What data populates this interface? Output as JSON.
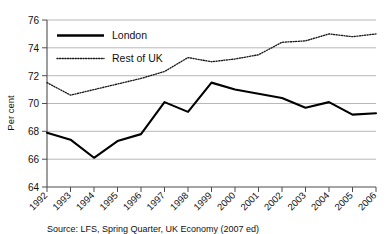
{
  "chart_data": {
    "type": "line",
    "title": "",
    "subtitle": "",
    "xlabel": "",
    "ylabel": "Per cent",
    "x": [
      "1992",
      "1993",
      "1994",
      "1995",
      "1996",
      "1997",
      "1998",
      "1999",
      "2000",
      "2001",
      "2002",
      "2003",
      "2004",
      "2005",
      "2006"
    ],
    "categories": [
      "1992",
      "1993",
      "1994",
      "1995",
      "1996",
      "1997",
      "1998",
      "1999",
      "2000",
      "2001",
      "2002",
      "2003",
      "2004",
      "2005",
      "2006"
    ],
    "ylim": [
      64,
      76
    ],
    "yticks": [
      64,
      66,
      68,
      70,
      72,
      74,
      76
    ],
    "ytick_labels": [
      "64",
      "66",
      "68",
      "70",
      "72",
      "74",
      "76"
    ],
    "grid": true,
    "legend_position": "top-left-inside",
    "series": [
      {
        "name": "London",
        "style": "solid",
        "color": "#000000",
        "values": [
          67.9,
          67.4,
          66.1,
          67.3,
          67.8,
          70.1,
          69.4,
          71.5,
          71.0,
          70.7,
          70.4,
          69.7,
          70.1,
          69.2,
          69.3
        ]
      },
      {
        "name": "Rest of UK",
        "style": "dotted",
        "color": "#1a1a1a",
        "values": [
          71.5,
          70.6,
          71.0,
          71.4,
          71.8,
          72.3,
          73.3,
          73.0,
          73.2,
          73.5,
          74.4,
          74.5,
          75.0,
          74.8,
          75.0
        ]
      }
    ],
    "source_note": "Source: LFS, Spring Quarter, UK Economy (2007 ed)"
  },
  "legend": {
    "items": [
      {
        "label": "London",
        "style": "solid"
      },
      {
        "label": "Rest of UK",
        "style": "dotted"
      }
    ]
  },
  "axes": {
    "y_title": "Per cent"
  }
}
